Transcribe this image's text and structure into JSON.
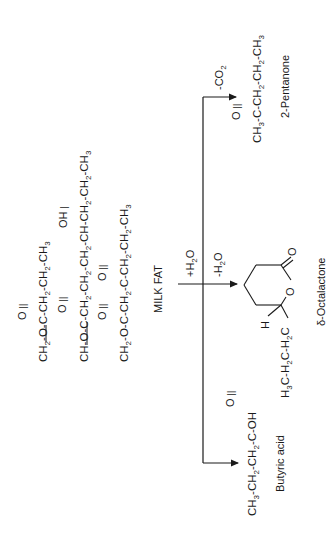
{
  "diagram": {
    "source": {
      "label": "MILK FAT",
      "triglyceride": {
        "chain1": {
          "prefix": "CH",
          "sub1": "2",
          "text": "-O-C-CH",
          "sub2": "2",
          "text2": "-CH",
          "sub3": "2",
          "text3": "-CH",
          "sub4": "3",
          "oxo": "O"
        },
        "chain2": {
          "text": "CH-O-C-CH",
          "sub1": "2",
          "text1": "-CH",
          "sub2": "2",
          "text2": "-CH",
          "sub3": "2",
          "text3": "-CH-CH",
          "sub4": "2",
          "text4": "-CH",
          "sub5": "2",
          "text5": "-CH",
          "sub6": "3",
          "oxo": "O",
          "hydroxyl": "OH"
        },
        "chain3": {
          "prefix": "CH",
          "sub1": "2",
          "text": "-O-C-CH",
          "sub2": "2",
          "text2": "-C-CH",
          "sub3": "2",
          "text3": "-CH",
          "sub4": "2",
          "text4": "-CH",
          "sub5": "3",
          "oxo1": "O",
          "oxo2": "O"
        }
      }
    },
    "pathways": [
      {
        "id": "pentanone",
        "condition": "-CO2",
        "product": "2-Pentanone",
        "formula": {
          "a": "CH",
          "s1": "3",
          "b": "-C-CH",
          "s2": "2",
          "c": "-CH",
          "s3": "2",
          "d": "-CH",
          "s4": "3",
          "oxo": "O"
        }
      },
      {
        "id": "octalactone",
        "condition_in": "+H2O",
        "condition_out": "-H2O",
        "product": "δ-Octalactone",
        "substituent": {
          "a": "H",
          "s1": "3",
          "b": "C-H",
          "s2": "2",
          "c": "C-H",
          "s3": "2",
          "d": "C"
        },
        "ring_h": "H",
        "ring_o": "O",
        "carbonyl_o": "O"
      },
      {
        "id": "butyric",
        "product": "Butyric acid",
        "formula": {
          "a": "CH",
          "s1": "3",
          "b": "-CH",
          "s2": "2",
          "c": "-CH",
          "s3": "2",
          "d": "-C-OH",
          "oxo": "O"
        }
      }
    ],
    "colors": {
      "ink": "#1a1a1a",
      "background": "#ffffff"
    }
  }
}
